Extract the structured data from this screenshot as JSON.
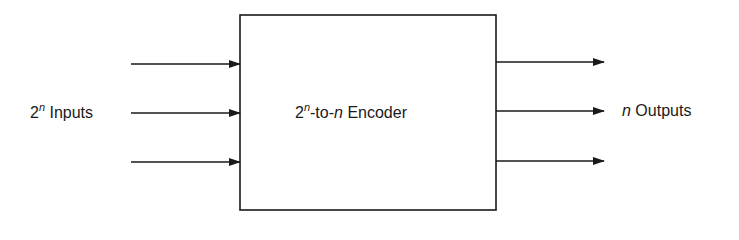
{
  "diagram": {
    "type": "block-diagram",
    "block": {
      "label_base": "2",
      "label_exp": "n",
      "label_mid": "-to-",
      "label_var": "n",
      "label_tail": " Encoder"
    },
    "inputs": {
      "label_base": "2",
      "label_exp": "n",
      "label_tail": " Inputs",
      "arrow_count": 3
    },
    "outputs": {
      "label_var": "n",
      "label_tail": " Outputs",
      "arrow_count": 3
    },
    "colors": {
      "stroke": "#1a1a1a",
      "background": "#ffffff"
    }
  }
}
